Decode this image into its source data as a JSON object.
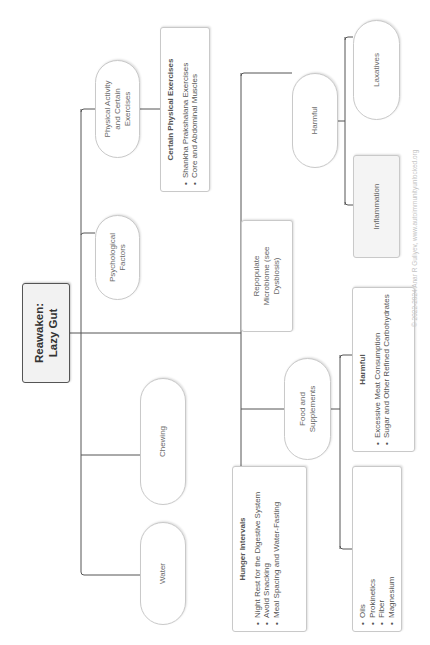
{
  "root": {
    "line1": "Reawaken:",
    "line2": "Lazy Gut"
  },
  "nodes": {
    "physical_activity": {
      "label": "Physical Activity and Certain Exercises"
    },
    "certain_exercises": {
      "title": "Certain Physical Exercises",
      "items": [
        "Shankha Prakshalana Exercises",
        "Core and Abdominal Muscles"
      ]
    },
    "psychological": {
      "label": "Psychological Factors"
    },
    "chewing": {
      "label": "Chewing"
    },
    "water": {
      "label": "Water"
    },
    "repopulate": {
      "label": "Repopulate Microbiome (see Dysbiosis)"
    },
    "harmful": {
      "label": "Harmful"
    },
    "laxatives": {
      "label": "Laxatives"
    },
    "inflammation": {
      "label": "Inflammation"
    },
    "food_supplements": {
      "label": "Food and Supplements"
    },
    "hunger_intervals": {
      "title": "Hunger Intervals",
      "items": [
        "Night Rest for the Digestive System",
        "Avoid Snacking",
        "Meal Spacing and Water-Fasting"
      ]
    },
    "food_harmful": {
      "title": "Harmful",
      "items": [
        "Excessive Meat Consumption",
        "Sugar and Other Refined Carbohydrates"
      ]
    },
    "food_helpful": {
      "items": [
        "Oils",
        "Prokinetics",
        "Fiber",
        "Magnesium"
      ]
    }
  },
  "copyright": "© 2022-2024 Anar R Guliyev, www.autoimmunityunlocked.org"
}
